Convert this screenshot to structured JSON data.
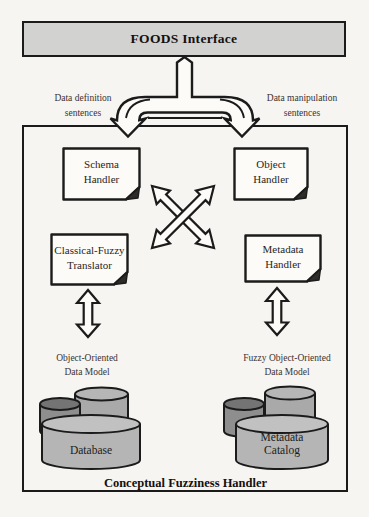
{
  "header": {
    "title": "FOODS Interface"
  },
  "flow_labels": {
    "left": "Data definition\nsentences",
    "right": "Data manipulation\nsentences"
  },
  "handlers": {
    "schema": "Schema\nHandler",
    "object": "Object\nHandler",
    "translator": "Classical-Fuzzy\nTranslator",
    "metadata": "Metadata\nHandler"
  },
  "data_models": {
    "left_label": "Object-Oriented\nData Model",
    "right_label": "Fuzzy Object-Oriented\nData Model",
    "left_store": "Database",
    "right_store": "Metadata\nCatalog"
  },
  "container": {
    "label": "Conceptual Fuzziness Handler"
  },
  "icons": {
    "split_arrow": "split-down-flow-arrow",
    "cross_exchange": "crossed-double-headed-arrows",
    "vertical_exchange": "double-headed-vertical-arrow",
    "document": "dog-eared-document-sheet",
    "datastore": "stacked-database-cylinders"
  },
  "colors": {
    "page_bg": "#f6f5f1",
    "line": "#1b1b1b",
    "header_fill": "#d2d2d0",
    "shape_fill": "#fcfbf8",
    "cylinder_front": "#b5b5b5",
    "cylinder_front_top": "#c1c1c1",
    "cylinder_back": "#a9a9a9",
    "cylinder_back_top": "#b6b6b6",
    "cylinder_dark": "#8e8e8e",
    "cylinder_dark_top": "#747474"
  }
}
